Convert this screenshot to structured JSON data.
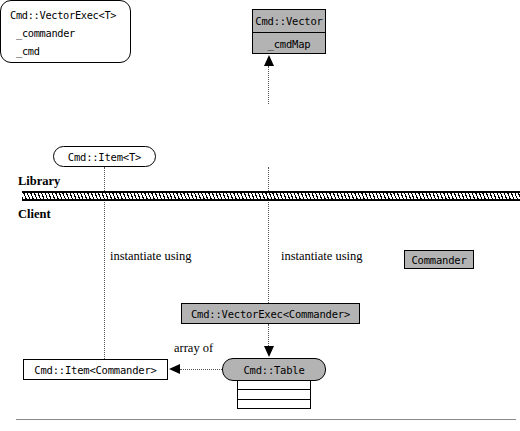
{
  "diagram": {
    "colors": {
      "node_fill_gray": "#b3b3b3",
      "node_fill_white": "#ffffff",
      "stroke": "#000000",
      "connector": "#555555",
      "bottom_rule": "#8a8a8a"
    },
    "bands": {
      "library_label": "Library",
      "client_label": "Client"
    },
    "nodes": {
      "vector": {
        "title": "Cmd::Vector",
        "member": "_cmdMap",
        "fill": "gray",
        "shape": "rectangle"
      },
      "vector_exec_t": {
        "title": "Cmd::VectorExec<T>",
        "member_1": "_commander",
        "member_2": "_cmd",
        "fill": "white",
        "shape": "rounded-rectangle"
      },
      "item_t": {
        "title": "Cmd::Item<T>",
        "fill": "white",
        "shape": "stadium"
      },
      "commander": {
        "title": "Commander",
        "fill": "gray",
        "shape": "rectangle"
      },
      "vector_exec_commander": {
        "title": "Cmd::VectorExec<Commander>",
        "fill": "gray",
        "shape": "rectangle"
      },
      "item_commander": {
        "title": "Cmd::Item<Commander>",
        "fill": "white",
        "shape": "rectangle"
      },
      "table": {
        "title": "Cmd::Table",
        "fill": "gray",
        "shape": "rounded-rectangle",
        "row_count": 3
      }
    },
    "annotations": {
      "instantiate_left": "instantiate using",
      "instantiate_right": "instantiate using",
      "array_of": "array of"
    }
  }
}
